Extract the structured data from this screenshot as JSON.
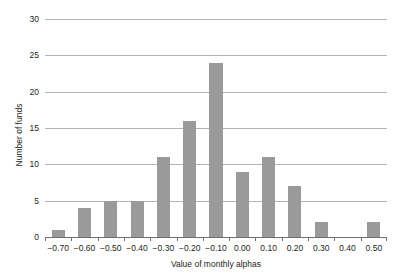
{
  "chart_data": {
    "type": "bar",
    "title": "",
    "xlabel": "Value of monthly alphas",
    "ylabel": "Number of funds",
    "categories": [
      "-0.70",
      "-0.60",
      "-0.50",
      "-0.40",
      "-0.30",
      "-0.20",
      "-0.10",
      "0.00",
      "0.10",
      "0.20",
      "0.30",
      "0.40",
      "0.50"
    ],
    "values": [
      1,
      4,
      5,
      5,
      11,
      16,
      24,
      9,
      11,
      7,
      2,
      0,
      2
    ],
    "ylim": [
      0,
      30
    ],
    "yticks": [
      0,
      5,
      10,
      15,
      20,
      25,
      30
    ],
    "ytick_labels": [
      "0",
      "5",
      "10",
      "15",
      "20",
      "25",
      "30"
    ],
    "xtick_labels": [
      "-0.70",
      "-0.60",
      "-0.50",
      "-0.40",
      "-0.30",
      "-0.20",
      "-0.10",
      "0.00",
      "0.10",
      "0.20",
      "0.30",
      "0.40",
      "0.50"
    ],
    "grid": true,
    "legend": false,
    "bar_color": "#9a9a9a",
    "gridline_color": "#b3b3b3",
    "axis_color": "#6f6f6f",
    "text_color": "#231f20"
  }
}
